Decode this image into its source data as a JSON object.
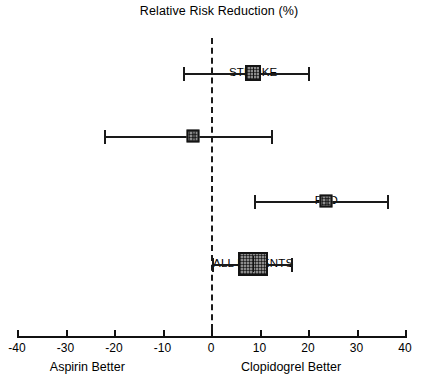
{
  "chart_data": {
    "type": "forest",
    "title": "Relative Risk Reduction (%)",
    "xlabel": "",
    "ylabel": "",
    "xlim": [
      -40,
      40
    ],
    "xticks": [
      -40,
      -30,
      -20,
      -10,
      0,
      10,
      20,
      30,
      40
    ],
    "xtick_labels": [
      "-40",
      "-30",
      "-20",
      "-10",
      "0",
      "10",
      "20",
      "30",
      "40"
    ],
    "grid": false,
    "reference_line": 0,
    "left_side_label": "Aspirin Better",
    "right_side_label": "Clopidogrel Better",
    "categories": [
      "STROKE",
      "MI",
      "PAD",
      "ALL PATIENTS"
    ],
    "values": [
      8.7,
      -3.7,
      23.8,
      8.7
    ],
    "ci_low": [
      -5.7,
      -22.1,
      8.9,
      0.3
    ],
    "ci_high": [
      20.1,
      12.4,
      36.2,
      16.5
    ],
    "rows": [
      {
        "label": "STROKE",
        "estimate": 8.7,
        "ci_low": -5.7,
        "ci_high": 20.1,
        "marker_width_px": 16,
        "marker_height_px": 16
      },
      {
        "label": "MI",
        "estimate": -3.7,
        "ci_low": -22.1,
        "ci_high": 12.4,
        "marker_width_px": 13,
        "marker_height_px": 13
      },
      {
        "label": "PAD",
        "estimate": 23.8,
        "ci_low": 8.9,
        "ci_high": 36.2,
        "marker_width_px": 13,
        "marker_height_px": 13
      },
      {
        "label": "ALL PATIENTS",
        "estimate": 8.7,
        "ci_low": 0.3,
        "ci_high": 16.5,
        "marker_width_px": 30,
        "marker_height_px": 24
      }
    ],
    "colors": {
      "marker_fill": "#8c8c8c",
      "marker_edge": "#141414",
      "line": "#1a1a1a",
      "axis": "#111111",
      "background": "#ffffff"
    }
  }
}
